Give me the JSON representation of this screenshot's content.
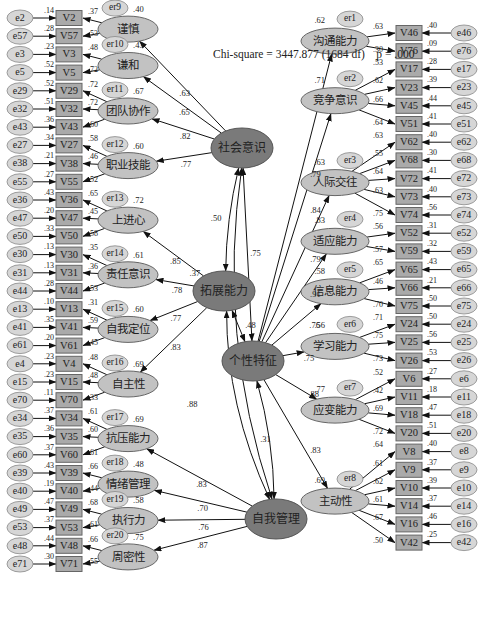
{
  "title": {
    "chi_square": "Chi-square = 3447.877 (1684 df)",
    "p_value": "p = .000"
  },
  "colors": {
    "indicator_fill": "#aaaaaa",
    "indicator_border": "#666666",
    "first_order_fill": "#c2c2c2",
    "second_order_fill": "#7a7a7a",
    "error_fill": "#d6d6d6",
    "line": "#111111"
  },
  "second_order_factors": [
    {
      "id": "SA",
      "label": "社会意识",
      "x": 242,
      "y": 148
    },
    {
      "id": "DC",
      "label": "拓展能力",
      "x": 224,
      "y": 291
    },
    {
      "id": "PT",
      "label": "个性特征",
      "x": 253,
      "y": 361
    },
    {
      "id": "SM",
      "label": "自我管理",
      "x": 276,
      "y": 519
    }
  ],
  "correlations": [
    {
      "from": "SA",
      "to": "DC",
      "value": ".50"
    },
    {
      "from": "SA",
      "to": "PT",
      "value": ".75"
    },
    {
      "from": "SA",
      "to": "SM",
      "value": ".37"
    },
    {
      "from": "DC",
      "to": "PT",
      "value": ".48"
    },
    {
      "from": "DC",
      "to": "SM",
      "value": ".88"
    },
    {
      "from": "PT",
      "to": "SM",
      "value": ".31"
    }
  ],
  "left_factors": [
    {
      "label": "谨慎",
      "parent": "SA",
      "path": ".63",
      "err": "er9",
      "r2": ".40",
      "x": 143,
      "y": 43,
      "indicators": [
        {
          "v": "V2",
          "e": "e2",
          "r2": ".14",
          "load": ".37"
        },
        {
          "v": "V57",
          "e": "e57",
          "r2": ".28",
          "load": ".53"
        }
      ]
    },
    {
      "label": "谦和",
      "parent": "SA",
      "path": ".65",
      "err": "er10",
      "r2": ".43",
      "x": 143,
      "y": 77,
      "indicators": [
        {
          "v": "V3",
          "e": "e3",
          "r2": ".23",
          "load": ".48"
        },
        {
          "v": "V5",
          "e": "e5",
          "r2": ".52",
          "load": ".72"
        }
      ]
    },
    {
      "label": "团队协作",
      "parent": "SA",
      "path": ".82",
      "err": "er11",
      "r2": ".67",
      "x": 143,
      "y": 122,
      "indicators": [
        {
          "v": "V29",
          "e": "e29",
          "r2": ".52",
          "load": ".72"
        },
        {
          "v": "V32",
          "e": "e32",
          "r2": ".51",
          "load": ".72"
        },
        {
          "v": "V43",
          "e": "e43",
          "r2": ".36",
          "load": ".60"
        }
      ]
    },
    {
      "label": "职业技能",
      "parent": "SA",
      "path": ".77",
      "err": "er12",
      "r2": ".60",
      "x": 143,
      "y": 174,
      "indicators": [
        {
          "v": "V27",
          "e": "e27",
          "r2": ".34",
          "load": ".58"
        },
        {
          "v": "V38",
          "e": "e38",
          "r2": ".21",
          "load": ".46"
        },
        {
          "v": "V55",
          "e": "e55",
          "r2": ".27",
          "load": ".52"
        }
      ]
    },
    {
      "label": "上进心",
      "parent": "DC",
      "path": ".85",
      "err": "er13",
      "r2": ".72",
      "x": 143,
      "y": 228,
      "indicators": [
        {
          "v": "V36",
          "e": "e36",
          "r2": ".43",
          "load": ".65"
        },
        {
          "v": "V47",
          "e": "e47",
          "r2": ".20",
          "load": ".45"
        },
        {
          "v": "V50",
          "e": "e50",
          "r2": ".33",
          "load": ".58"
        }
      ]
    },
    {
      "label": "责任意识",
      "parent": "DC",
      "path": ".78",
      "err": "er14",
      "r2": ".61",
      "x": 143,
      "y": 282,
      "indicators": [
        {
          "v": "V30",
          "e": "e30",
          "r2": ".13",
          "load": ".35"
        },
        {
          "v": "V31",
          "e": "e31",
          "r2": ".13",
          "load": ".36"
        },
        {
          "v": "V44",
          "e": "e44",
          "r2": ".28",
          "load": ".53"
        }
      ]
    },
    {
      "label": "自我定位",
      "parent": "DC",
      "path": ".77",
      "err": "er15",
      "r2": ".60",
      "x": 143,
      "y": 336,
      "indicators": [
        {
          "v": "V13",
          "e": "e13",
          "r2": ".10",
          "load": ".31"
        },
        {
          "v": "V41",
          "e": "e41",
          "r2": ".35",
          "load": ".59"
        },
        {
          "v": "V61",
          "e": "e61",
          "r2": ".20",
          "load": ".45"
        }
      ]
    },
    {
      "label": "自主性",
      "parent": "DC",
      "path": ".83",
      "err": "er16",
      "r2": ".69",
      "x": 143,
      "y": 389,
      "indicators": [
        {
          "v": "V4",
          "e": "e4",
          "r2": ".23",
          "load": ".48"
        },
        {
          "v": "V15",
          "e": "e15",
          "r2": ".23",
          "load": ".48"
        },
        {
          "v": "V70",
          "e": "e70",
          "r2": ".11",
          "load": ".33"
        }
      ]
    },
    {
      "label": "抗压能力",
      "parent": "SM",
      "path": ".83",
      "err": "er17",
      "r2": ".69",
      "x": 143,
      "y": 443,
      "indicators": [
        {
          "v": "V34",
          "e": "e34",
          "r2": ".37",
          "load": ".61"
        },
        {
          "v": "V35",
          "e": "e35",
          "r2": ".36",
          "load": ".60"
        },
        {
          "v": "V60",
          "e": "e60",
          "r2": ".37",
          "load": ".61"
        }
      ]
    },
    {
      "label": "情绪管理",
      "parent": "SM",
      "path": ".70",
      "err": "er18",
      "r2": ".48",
      "x": 143,
      "y": 489,
      "indicators": [
        {
          "v": "V39",
          "e": "e39",
          "r2": ".43",
          "load": ".66"
        },
        {
          "v": "V40",
          "e": "e40",
          "r2": ".19",
          "load": ".44"
        }
      ]
    },
    {
      "label": "执行力",
      "parent": "SM",
      "path": ".76",
      "err": "er19",
      "r2": ".58",
      "x": 143,
      "y": 524,
      "indicators": [
        {
          "v": "V49",
          "e": "e49",
          "r2": ".47",
          "load": ".68"
        },
        {
          "v": "V53",
          "e": "e53",
          "r2": ".37",
          "load": ".61"
        }
      ]
    },
    {
      "label": "周密性",
      "parent": "SM",
      "path": ".87",
      "err": "er20",
      "r2": ".75",
      "x": 143,
      "y": 561,
      "indicators": [
        {
          "v": "V48",
          "e": "e48",
          "r2": ".44",
          "load": ".66"
        },
        {
          "v": "V71",
          "e": "e71",
          "r2": ".30",
          "load": ".55"
        }
      ]
    }
  ],
  "right_factors": [
    {
      "label": "沟通能力",
      "parent": "PT",
      "path": ".79",
      "err": "er1",
      "r2": ".62",
      "x": 335,
      "y": 99,
      "indicators": [
        {
          "v": "V46",
          "e": "e46",
          "r2": ".40",
          "load": ".63"
        },
        {
          "v": "V76",
          "e": "e76",
          "r2": ".09",
          "load": ".30"
        }
      ]
    },
    {
      "label": "竞争意识",
      "parent": "PT",
      "path": ".84",
      "err": "er2",
      "r2": ".71",
      "x": 335,
      "y": 156,
      "indicators": [
        {
          "v": "V17",
          "e": "e17",
          "r2": ".28",
          "load": ".53"
        },
        {
          "v": "V23",
          "e": "e23",
          "r2": ".39",
          "load": ".62"
        },
        {
          "v": "V45",
          "e": "e45",
          "r2": ".44",
          "load": ".66"
        },
        {
          "v": "V51",
          "e": "e51",
          "r2": ".41",
          "load": ".64"
        }
      ]
    },
    {
      "label": "人际交往",
      "parent": "PT",
      "path": ".79",
      "err": "er3",
      "r2": ".63",
      "x": 335,
      "y": 237,
      "indicators": [
        {
          "v": "V62",
          "e": "e62",
          "r2": ".40",
          "load": ".63"
        },
        {
          "v": "V68",
          "e": "e68",
          "r2": ".30",
          "load": ".55"
        },
        {
          "v": "V72",
          "e": "e72",
          "r2": ".41",
          "load": ".64"
        },
        {
          "v": "V73",
          "e": "e73",
          "r2": ".40",
          "load": ".63"
        },
        {
          "v": "V74",
          "e": "e74",
          "r2": ".56",
          "load": ".75"
        }
      ]
    },
    {
      "label": "适应能力",
      "parent": "PT",
      "path": ".91",
      "err": "er4",
      "r2": ".83",
      "x": 335,
      "y": 305,
      "indicators": [
        {
          "v": "V52",
          "e": "e52",
          "r2": ".31",
          "load": ".56"
        },
        {
          "v": "V59",
          "e": "e59",
          "r2": ".32",
          "load": ".57"
        }
      ]
    },
    {
      "label": "信息能力",
      "parent": "PT",
      "path": ".76",
      "err": "er5",
      "r2": ".58",
      "x": 335,
      "y": 350,
      "indicators": [
        {
          "v": "V65",
          "e": "e65",
          "r2": ".43",
          "load": ".65"
        },
        {
          "v": "V66",
          "e": "e66",
          "r2": ".21",
          "load": ".46"
        },
        {
          "v": "V75",
          "e": "e75",
          "r2": ".50",
          "load": ".70"
        }
      ]
    },
    {
      "label": "学习能力",
      "parent": "PT",
      "path": ".75",
      "err": "er6",
      "r2": ".56",
      "x": 335,
      "y": 404,
      "indicators": [
        {
          "v": "V24",
          "e": "e24",
          "r2": ".50",
          "load": ".71"
        },
        {
          "v": "V25",
          "e": "e25",
          "r2": ".56",
          "load": ".75"
        },
        {
          "v": "V26",
          "e": "e26",
          "r2": ".53",
          "load": ".73"
        }
      ]
    },
    {
      "label": "应变能力",
      "parent": "PT",
      "path": ".88",
      "err": "er7",
      "r2": ".77",
      "x": 335,
      "y": 467,
      "indicators": [
        {
          "v": "V6",
          "e": "e6",
          "r2": ".27",
          "load": ".52"
        },
        {
          "v": "V11",
          "e": "e11",
          "r2": ".18",
          "load": ".42"
        },
        {
          "v": "V18",
          "e": "e18",
          "r2": ".47",
          "load": ".69"
        },
        {
          "v": "V20",
          "e": "e20",
          "r2": ".51",
          "load": ".72"
        }
      ]
    },
    {
      "label": "主动性",
      "parent": "PT",
      "path": ".83",
      "err": "er8",
      "r2": ".69",
      "x": 335,
      "y": 566,
      "indicators": [
        {
          "v": "V8",
          "e": "e8",
          "r2": ".40",
          "load": ".64"
        },
        {
          "v": "V9",
          "e": "e9",
          "r2": ".37",
          "load": ".61"
        },
        {
          "v": "V10",
          "e": "e10",
          "r2": ".39",
          "load": ".62"
        },
        {
          "v": "V14",
          "e": "e14",
          "r2": ".37",
          "load": ".61"
        },
        {
          "v": "V16",
          "e": "e16",
          "r2": ".46",
          "load": ".67"
        },
        {
          "v": "V42",
          "e": "e42",
          "r2": ".25",
          "load": ".50"
        }
      ]
    }
  ]
}
